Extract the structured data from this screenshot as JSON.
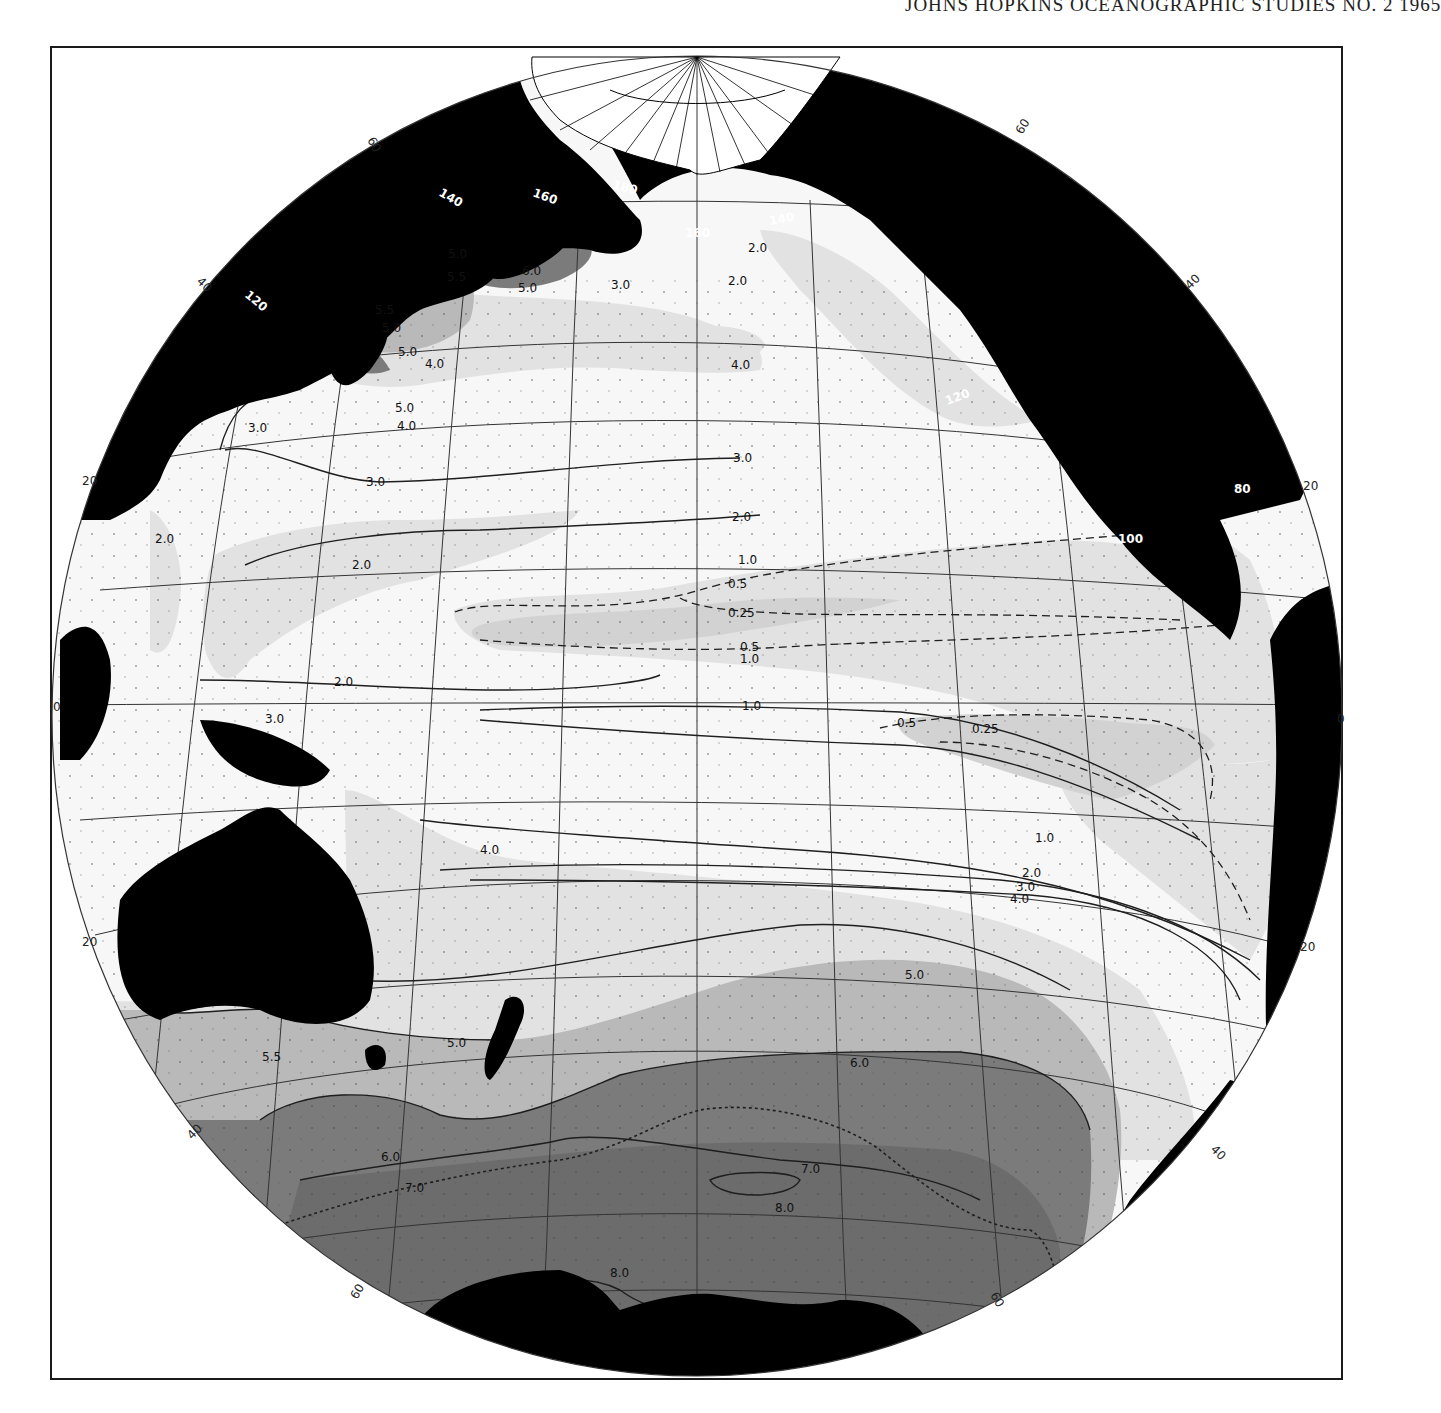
{
  "page": {
    "running_head": "JOHNS HOPKINS OCEANOGRAPHIC STUDIES NO. 2 1965"
  },
  "map": {
    "projection": "Pacific Ocean hemispheric projection",
    "colors": {
      "land": "#000000",
      "background": "#ffffff",
      "tone_lightest": "#f7f7f7",
      "tone_light": "#e2e2e2",
      "tone_medium": "#b9b9b9",
      "tone_dark": "#7b7b7b",
      "tone_darkest": "#5f5f5f",
      "contour": "#1e1e1e",
      "grid": "#333333"
    },
    "latitude_labels": {
      "top_left_60": "60",
      "top_right_60": "60",
      "left_40_north": "40",
      "right_40_north": "40",
      "left_20_north": "20",
      "right_20_north": "20",
      "left_0": "0",
      "right_0": "0",
      "left_20_south": "20",
      "right_20_south": "20",
      "left_40_south": "40",
      "right_40_south": "40",
      "bottom_left_60": "60",
      "bottom_right_60": "60"
    },
    "longitude_labels": {
      "lon_120e": "120",
      "lon_140e": "140",
      "lon_160e": "160",
      "lon_180": "180",
      "lon_160w": "160",
      "lon_140w": "140",
      "lon_120w": "120",
      "lon_100w": "100",
      "lon_80w": "80"
    },
    "contour_labels": {
      "nw_5_0_a": "5.0",
      "nw_5_5_a": "5.5",
      "nw_6_0": "6.0",
      "nw_5_0_b": "5.0",
      "nw_5_5_b": "5.5",
      "nw_5_0_c": "5.0",
      "nw_5_0_d": "5.0",
      "nw_4_0_a": "4.0",
      "nw_5_0_e": "5.0",
      "nw_4_0_b": "4.0",
      "nw_3_0_a": "3.0",
      "aleut_3_0": "3.0",
      "alaska_2_0_a": "2.0",
      "alaska_2_0_b": "2.0",
      "ne_4_0": "4.0",
      "np_3_0_a": "3.0",
      "np_3_0_b": "3.0",
      "np_2_0_a": "2.0",
      "np_2_0_b": "2.0",
      "np_1_0": "1.0",
      "np_2_0_c": "2.0",
      "wp_2_0": "2.0",
      "eq_0_5_a": "0.5",
      "eq_0_25_a": "0.25",
      "eq_0_5_b": "0.5",
      "eq_1_0_a": "1.0",
      "eq_1_0_b": "1.0",
      "eq_3_0": "3.0",
      "ep_0_5": "0.5",
      "ep_0_25": "0.25",
      "sp_1_0": "1.0",
      "sp_2_0": "2.0",
      "sp_3_0": "3.0",
      "sp_4_0_a": "4.0",
      "sp_4_0_b": "4.0",
      "ss_5_0_a": "5.0",
      "ss_5_0_b": "5.0",
      "ss_5_5": "5.5",
      "ss_6_0_a": "6.0",
      "ss_6_0_b": "6.0",
      "ss_7_0_a": "7.0",
      "ss_7_0_b": "7.0",
      "ss_8_0_a": "8.0",
      "ss_8_0_b": "8.0"
    },
    "contour_values": [
      "0.25",
      "0.5",
      "1.0",
      "2.0",
      "3.0",
      "4.0",
      "5.0",
      "5.5",
      "6.0",
      "7.0",
      "8.0"
    ]
  }
}
